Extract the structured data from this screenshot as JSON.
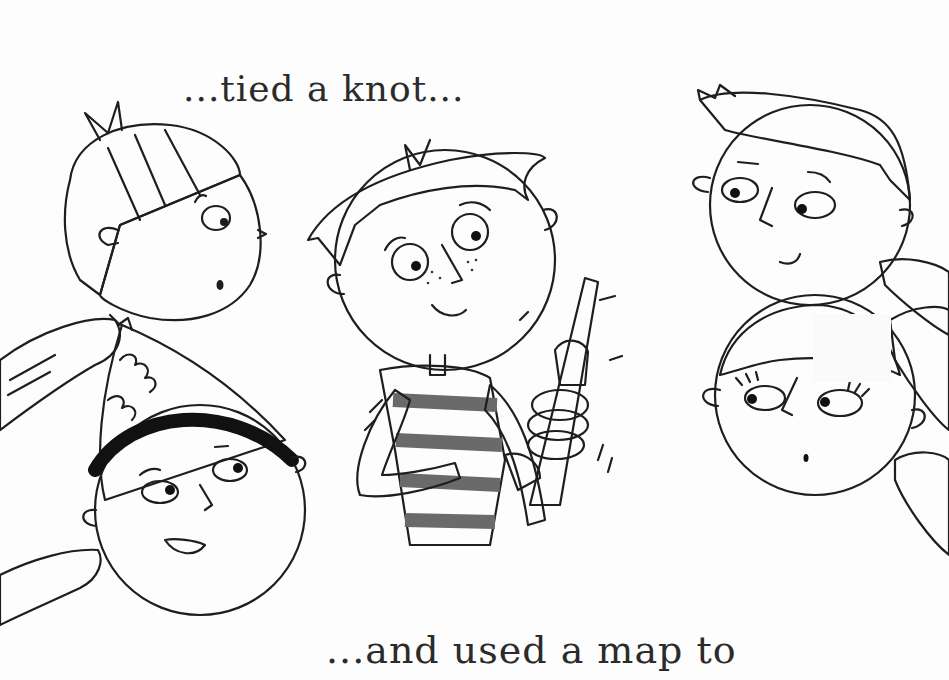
{
  "page": {
    "type": "illustrated children's book page",
    "palette": {
      "background": "#fdfdfd",
      "ink": "#1e1e1e",
      "skin_light": "#c9c9c9",
      "skin_dark": "#7a7a7a",
      "hair_dark": "#1a1a1a",
      "sleeve": "#6a6a6a"
    }
  },
  "captions": {
    "top": "...tied a knot...",
    "bottom": "...and used a map to"
  },
  "characters": [
    {
      "id": "blond-boy",
      "position": "top-left",
      "expression": "surprised"
    },
    {
      "id": "boy-with-hat",
      "position": "bottom-left",
      "expression": "smiling"
    },
    {
      "id": "center-boy",
      "position": "center",
      "action": "holding knotted rope",
      "shirt": "striped"
    },
    {
      "id": "spiky-hair-boy",
      "position": "top-right",
      "expression": "smiling"
    },
    {
      "id": "girl",
      "position": "bottom-right",
      "expression": "surprised"
    }
  ]
}
